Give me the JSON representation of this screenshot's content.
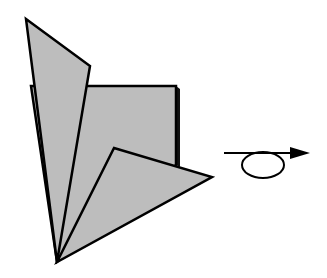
{
  "diagram": {
    "type": "origami-fold-step",
    "colors": {
      "background": "#ffffff",
      "paper_fill": "#bdbdbd",
      "outline": "#000000",
      "shadow": "#111111"
    },
    "shapes": {
      "back_square": {
        "points": "31,86 176,86 176,165 57,262",
        "label": "back square flap"
      },
      "top_flap": {
        "points": "26,19 90,66 57,262",
        "label": "top flap"
      },
      "bottom_flap": {
        "points": "114,148 212,177 57,262",
        "label": "bottom flap"
      }
    },
    "symbol": {
      "name": "turn-over-arrow",
      "meaning": "turn the model over",
      "line": {
        "x1": 224,
        "y1": 153,
        "x2": 300,
        "y2": 153
      },
      "loop": {
        "cx": 263,
        "cy": 165,
        "rx": 22,
        "ry": 13
      }
    }
  }
}
